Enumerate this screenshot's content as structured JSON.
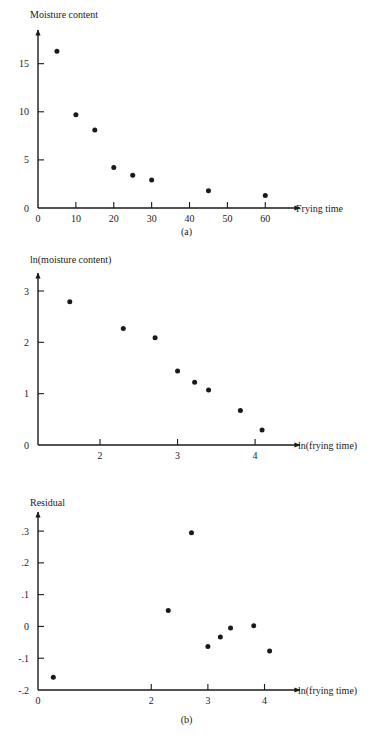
{
  "figure": {
    "panels": [
      {
        "id": "a",
        "caption": "(a)",
        "ylabel": "Moisture content",
        "xlabel": "Frying time"
      },
      {
        "id": "b",
        "caption": "(b)",
        "ylabel": "ln(moisture content)",
        "xlabel": "ln(frying time)"
      },
      {
        "id": "c",
        "caption": "(c)",
        "ylabel": "Residual",
        "xlabel": "ln(frying time)"
      }
    ]
  },
  "chart_data": [
    {
      "type": "scatter",
      "panel": "a",
      "title": "",
      "xlabel": "Frying time",
      "ylabel": "Moisture content",
      "xlim": [
        0,
        66
      ],
      "ylim": [
        0,
        18.5
      ],
      "xticks": [
        0,
        10,
        20,
        30,
        40,
        50,
        60
      ],
      "xticklabels": [
        "0",
        "10",
        "20",
        "30",
        "40",
        "50",
        "60"
      ],
      "yticks": [
        0,
        5,
        10,
        15
      ],
      "yticklabels": [
        "0",
        "5",
        "10",
        "15"
      ],
      "grid": false,
      "legend": "none",
      "x": [
        5,
        10,
        15,
        20,
        25,
        30,
        45,
        60
      ],
      "y": [
        16.3,
        9.7,
        8.1,
        4.2,
        3.4,
        2.9,
        1.8,
        1.3
      ]
    },
    {
      "type": "scatter",
      "panel": "b",
      "title": "",
      "xlabel": "ln(frying time)",
      "ylabel": "ln(moisture content)",
      "xlim": [
        1.2,
        4.45
      ],
      "ylim": [
        0,
        3.35
      ],
      "xticks": [
        2,
        3,
        4
      ],
      "xticklabels": [
        "2",
        "3",
        "4"
      ],
      "yticks": [
        0,
        1,
        2,
        3
      ],
      "yticklabels": [
        "0",
        "1",
        "2",
        "3"
      ],
      "grid": false,
      "legend": "none",
      "x": [
        1.61,
        2.3,
        2.71,
        3.0,
        3.22,
        3.4,
        3.81,
        4.09
      ],
      "y": [
        2.79,
        2.27,
        2.09,
        1.44,
        1.22,
        1.07,
        0.67,
        0.29
      ]
    },
    {
      "type": "scatter",
      "panel": "c",
      "title": "",
      "xlabel": "ln(frying time)",
      "ylabel": "Residual",
      "xlim": [
        0,
        4.45
      ],
      "ylim": [
        -0.2,
        0.36
      ],
      "xticks": [
        0,
        2,
        3,
        4
      ],
      "xticklabels": [
        "0",
        "2",
        "3",
        "4"
      ],
      "yticks": [
        -0.2,
        -0.1,
        0,
        0.1,
        0.2,
        0.3
      ],
      "yticklabels": [
        "-.2",
        "-.1",
        "0",
        ".1",
        ".2",
        ".3"
      ],
      "grid": false,
      "legend": "none",
      "x": [
        0.27,
        2.3,
        2.71,
        3.0,
        3.22,
        3.4,
        3.81,
        4.09
      ],
      "y": [
        -0.16,
        0.05,
        0.295,
        -0.063,
        -0.033,
        -0.005,
        0.002,
        -0.077
      ]
    }
  ]
}
